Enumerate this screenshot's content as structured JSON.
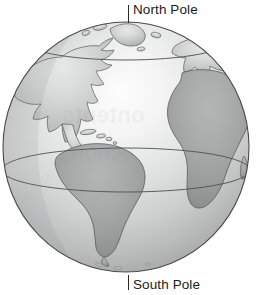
{
  "figure": {
    "kind": "globe-diagram",
    "alt": "Shaded grayscale globe centered on the Atlantic Ocean"
  },
  "labels": {
    "north_pole": "North Pole",
    "south_pole": "South Pole"
  },
  "watermark": {
    "line1": "ontents",
    "line2": "ection"
  },
  "colors": {
    "ocean_light": "#f3f3f3",
    "ocean_mid": "#d2d3d3",
    "ocean_dark": "#a7a9a9",
    "land_light": "#c9cbcb",
    "land_dark": "#9a9c9c",
    "outline": "#4a4a4a",
    "grid_line": "#555555",
    "label_text": "#1b1b1b",
    "background": "#ffffff"
  },
  "geometry": {
    "center_x": 126,
    "center_y": 147,
    "radius_x": 123,
    "radius_y": 125,
    "equator_y": 170,
    "arctic_circle_y": 40
  },
  "features": [
    {
      "name": "north-america",
      "tone": "light"
    },
    {
      "name": "greenland",
      "tone": "light"
    },
    {
      "name": "south-america",
      "tone": "dark"
    },
    {
      "name": "africa",
      "tone": "dark"
    },
    {
      "name": "europe",
      "tone": "light"
    },
    {
      "name": "caribbean-islands",
      "tone": "light"
    },
    {
      "name": "arctic-circle",
      "tone": "line"
    },
    {
      "name": "equator",
      "tone": "line"
    }
  ]
}
